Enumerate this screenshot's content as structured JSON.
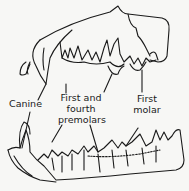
{
  "diagram": {
    "line_color": "#1a1a1a",
    "background": "#f7f7f5",
    "labels": [
      {
        "id": "canine",
        "text": "Canine"
      },
      {
        "id": "premolars_line1",
        "text": "First and"
      },
      {
        "id": "premolars_line2",
        "text": "fourth"
      },
      {
        "id": "premolars_line3",
        "text": "premolars"
      },
      {
        "id": "molar_line1",
        "text": "First"
      },
      {
        "id": "molar_line2",
        "text": "molar"
      }
    ]
  }
}
